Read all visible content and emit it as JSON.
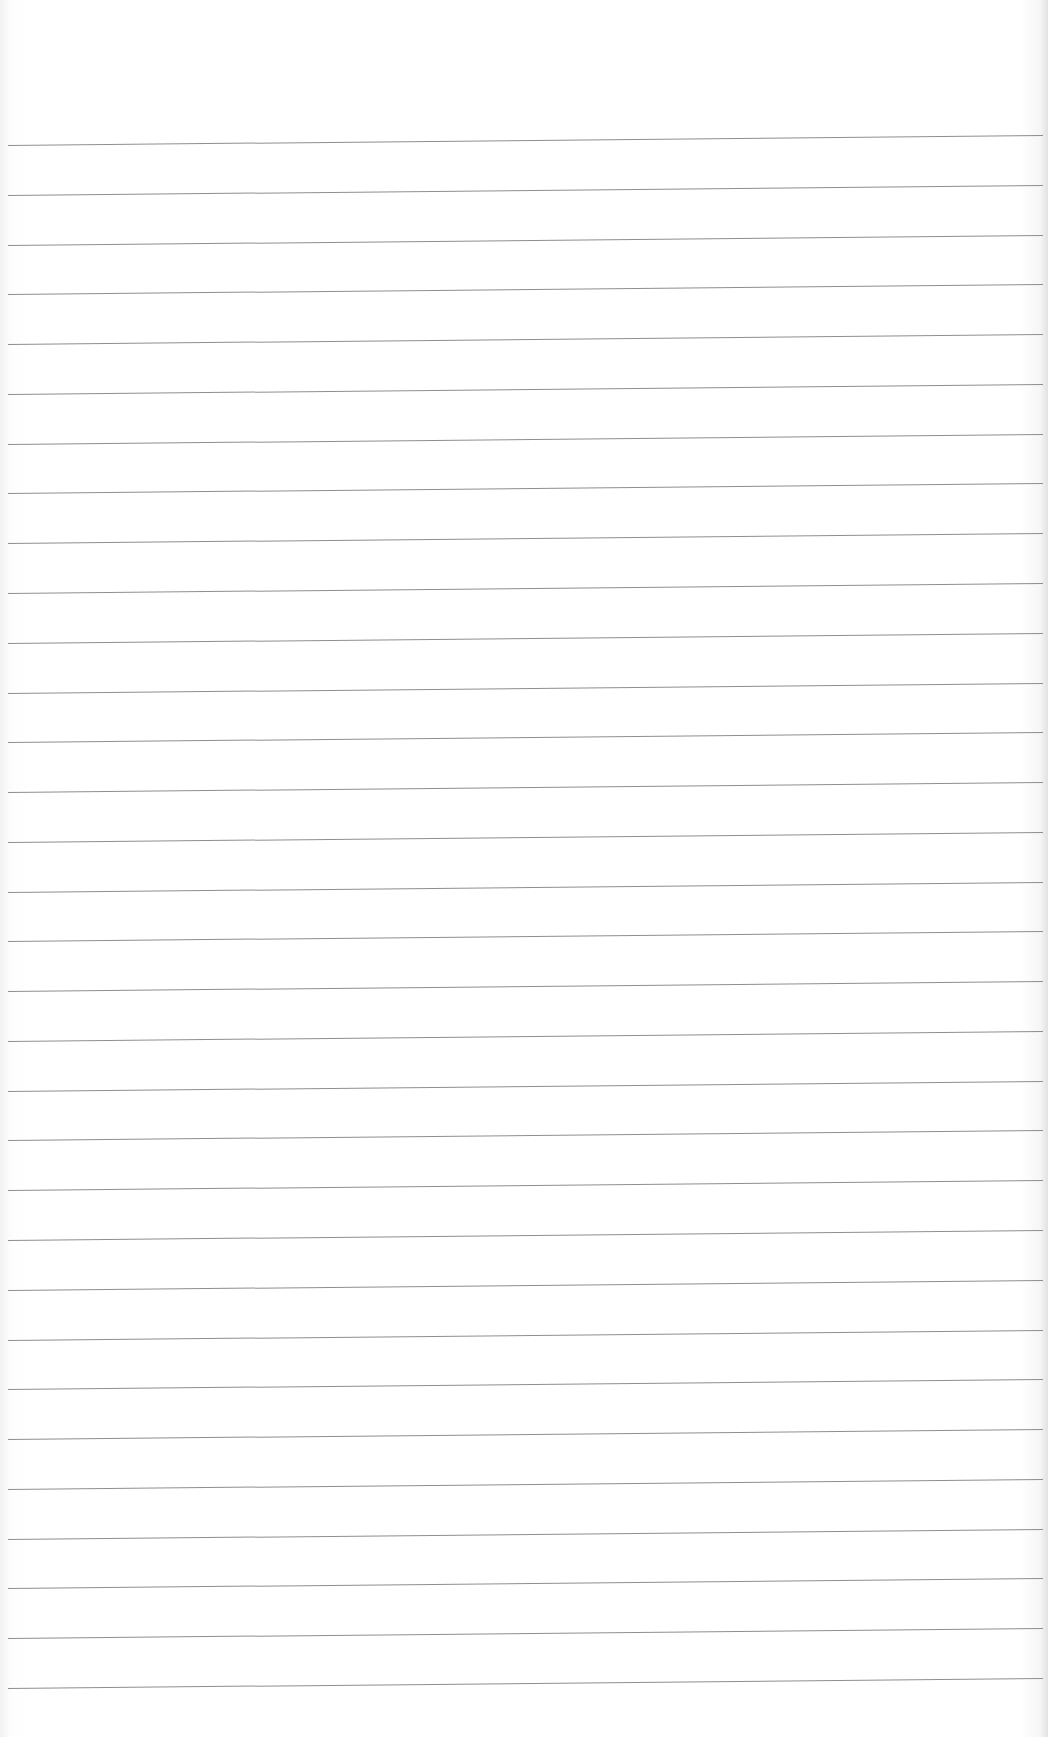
{
  "document": {
    "type": "ruled-paper",
    "background_color": "#ffffff",
    "rule_color": "#7a7a7a",
    "rule_count": 32,
    "first_rule_y": 145,
    "last_rule_y": 1688,
    "text_content": ""
  }
}
